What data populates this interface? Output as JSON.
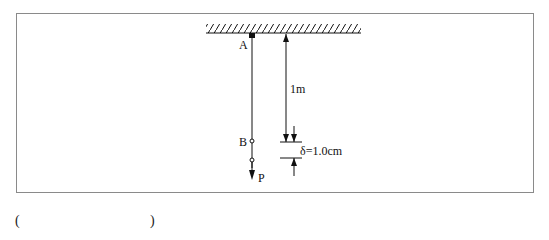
{
  "diagram": {
    "type": "physics-rod-hanging",
    "labels": {
      "top_point": "A",
      "middle_point": "B",
      "load": "P",
      "length": "1m",
      "displacement": "δ=1.0cm"
    },
    "answer_blank": {
      "open": "(",
      "close": ")"
    },
    "colors": {
      "line": "#111111",
      "frame": "#8a8a8a"
    }
  }
}
